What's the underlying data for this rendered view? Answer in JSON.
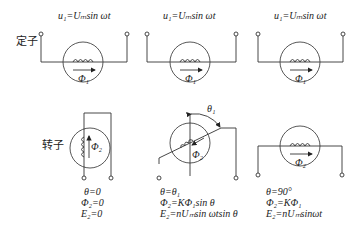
{
  "labels": {
    "stator": "定子",
    "rotor": "转子"
  },
  "stators": [
    {
      "equation": "u₁=Uₘsin ωt",
      "flux": "Φ₁"
    },
    {
      "equation": "u₁=Uₘsin ωt",
      "flux": "Φ₁"
    },
    {
      "equation": "u₁=Uₘsin ωt",
      "flux": "Φ₁"
    }
  ],
  "rotors": [
    {
      "flux": "Φ₂",
      "conditions": [
        "θ=0",
        "Φ₂=0",
        "E₂=0"
      ]
    },
    {
      "flux": "Φ₂",
      "angle_label": "θ₁",
      "conditions": [
        "θ=θ₁",
        "Φ₂=KΦ₁sin θ",
        "E₂=nUₘsin ωtsin θ"
      ]
    },
    {
      "flux": "Φ₂",
      "conditions": [
        "θ=90°",
        "Φ₂=KΦ₁",
        "E₂=nUₘsinωt"
      ]
    }
  ]
}
